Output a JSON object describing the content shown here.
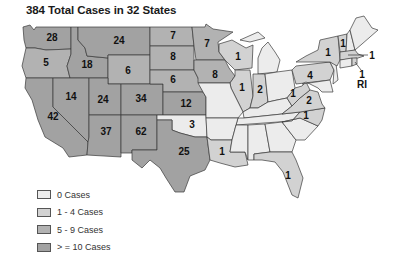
{
  "title": "384 Total Cases in 32 States",
  "colors": {
    "zero": "#ececec",
    "low": "#d2d2d2",
    "mid": "#b2b2b2",
    "high": "#a2a2a2",
    "stroke": "#3a3a3a"
  },
  "legend": [
    {
      "label": "0 Cases",
      "color": "#ececec"
    },
    {
      "label": "1 - 4 Cases",
      "color": "#d2d2d2"
    },
    {
      "label": "5 - 9 Cases",
      "color": "#b2b2b2"
    },
    {
      "label": "> = 10 Cases",
      "color": "#a2a2a2"
    }
  ],
  "states": {
    "WA": "28",
    "OR": "5",
    "CA": "42",
    "ID": "18",
    "NV": "14",
    "MT": "24",
    "WY": "6",
    "UT": "24",
    "CO": "34",
    "AZ": "37",
    "NM": "62",
    "ND": "7",
    "SD": "8",
    "NE": "6",
    "KS": "12",
    "OK": "3",
    "TX": "25",
    "MN": "7",
    "IA": "8",
    "WI": "1",
    "IL": "1",
    "IN": "2",
    "LA": "1",
    "FL": "1",
    "NY": "1",
    "VT": "1",
    "PA": "4",
    "WV": "1",
    "VA": "2",
    "NC": "1",
    "MA": "1",
    "RI": "1"
  },
  "annotations": {
    "ri_label": "RI"
  }
}
